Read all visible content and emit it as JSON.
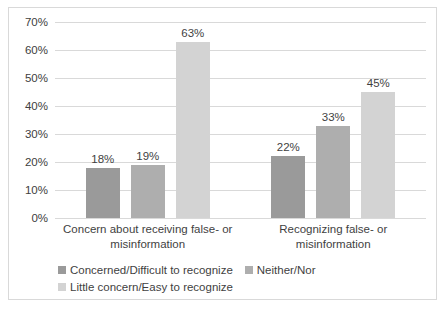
{
  "chart_data": {
    "type": "bar",
    "title": "",
    "xlabel": "",
    "ylabel": "",
    "ylim": [
      0,
      70
    ],
    "grid": true,
    "legend_position": "bottom",
    "categories": [
      "Concern about receiving false- or misinformation",
      "Recognizing false- or misinformation"
    ],
    "series": [
      {
        "name": "Concerned/Difficult to recognize",
        "color": "#9a9a9a",
        "values": [
          18,
          22
        ],
        "labels": [
          "18%",
          "22%"
        ]
      },
      {
        "name": "Neither/Nor",
        "color": "#aeaeae",
        "values": [
          19,
          33
        ],
        "labels": [
          "19%",
          "33%"
        ]
      },
      {
        "name": "Little concern/Easy to recognize",
        "color": "#d3d3d3",
        "values": [
          63,
          45
        ],
        "labels": [
          "63%",
          "45%"
        ]
      }
    ],
    "yticks": [
      "0%",
      "10%",
      "20%",
      "30%",
      "40%",
      "50%",
      "60%",
      "70%"
    ],
    "ytick_values": [
      0,
      10,
      20,
      30,
      40,
      50,
      60,
      70
    ]
  },
  "axis": {
    "ticks": [
      {
        "label": "70%",
        "value": 70
      },
      {
        "label": "60%",
        "value": 60
      },
      {
        "label": "50%",
        "value": 50
      },
      {
        "label": "40%",
        "value": 40
      },
      {
        "label": "30%",
        "value": 30
      },
      {
        "label": "20%",
        "value": 20
      },
      {
        "label": "10%",
        "value": 10
      },
      {
        "label": "0%",
        "value": 0
      }
    ]
  },
  "categories": [
    {
      "line1": "Concern about receiving false- or",
      "line2": "misinformation"
    },
    {
      "line1": "Recognizing false- or misinformation",
      "line2": ""
    }
  ],
  "bars": [
    {
      "label": "18%",
      "value": 18,
      "series": "Concerned/Difficult to recognize",
      "group": 0
    },
    {
      "label": "19%",
      "value": 19,
      "series": "Neither/Nor",
      "group": 0
    },
    {
      "label": "63%",
      "value": 63,
      "series": "Little concern/Easy to recognize",
      "group": 0
    },
    {
      "label": "22%",
      "value": 22,
      "series": "Concerned/Difficult to recognize",
      "group": 1
    },
    {
      "label": "33%",
      "value": 33,
      "series": "Neither/Nor",
      "group": 1
    },
    {
      "label": "45%",
      "value": 45,
      "series": "Little concern/Easy to recognize",
      "group": 1
    }
  ],
  "legend": {
    "row1": [
      {
        "label": "Concerned/Difficult to recognize",
        "color": "#9a9a9a"
      },
      {
        "label": "Neither/Nor",
        "color": "#aeaeae"
      }
    ],
    "row2": [
      {
        "label": "Little concern/Easy to recognize",
        "color": "#d3d3d3"
      }
    ]
  },
  "colors": {
    "border": "#d9d9d9",
    "gridline": "#d9d9d9",
    "text": "#3f3f3f",
    "background": "#ffffff"
  }
}
